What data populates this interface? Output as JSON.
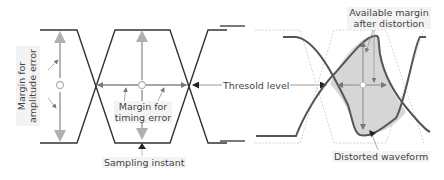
{
  "diagram": {
    "type": "eye-diagram",
    "panels": [
      "ideal eye pattern",
      "distorted eye pattern"
    ],
    "labels": {
      "amplitude_margin_line1": "Margin for",
      "amplitude_margin_line2": "amplitude error",
      "timing_margin_line1": "Margin for",
      "timing_margin_line2": "timing error",
      "sampling_instant": "Sampling instant",
      "threshold_level": "Thresold level",
      "available_margin_line1": "Available margin",
      "available_margin_line2": "after distortion",
      "distorted_waveform": "Distorted waveform"
    },
    "colors": {
      "waveform": "#333333",
      "margin_arrow": "#b5b5b5",
      "threshold_arrow": "#888888",
      "eye_fill": "#d6d6d6",
      "ideal_outline": "#c8c8c8",
      "label_bg": "#f3f3f3",
      "text": "#444444"
    }
  }
}
